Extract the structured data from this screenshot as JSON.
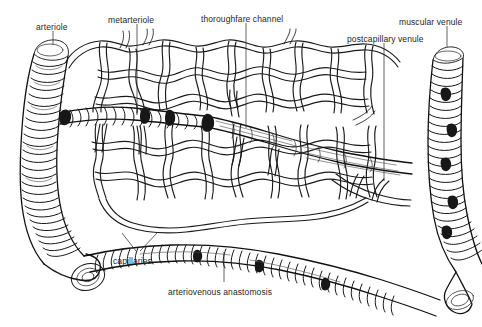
{
  "figure": {
    "background_color": "#ffffff",
    "ink_color": "#1a1a1a",
    "text_color": "#262626",
    "width": 482,
    "height": 327
  },
  "labels": [
    {
      "id": "arteriole",
      "text": "arteriole",
      "x": 36,
      "y": 22
    },
    {
      "id": "metarteriole",
      "text": "metarteriole",
      "x": 108,
      "y": 15
    },
    {
      "id": "thoroughfare-channel",
      "text": "thoroughfare channel",
      "x": 201,
      "y": 14
    },
    {
      "id": "postcapillary-venule",
      "text": "postcapillary venule",
      "x": 347,
      "y": 34
    },
    {
      "id": "muscular-venule",
      "text": "muscular venule",
      "x": 399,
      "y": 17
    },
    {
      "id": "capillaries",
      "text": "capillaries",
      "x": 113,
      "y": 256
    },
    {
      "id": "arteriovenous-anastomosis",
      "text": "arteriovenous anastomosis",
      "x": 168,
      "y": 287
    }
  ],
  "structures": [
    {
      "id": "arteriole-vessel",
      "name": "arteriole"
    },
    {
      "id": "metarteriole-vessel",
      "name": "metarteriole"
    },
    {
      "id": "thoroughfare-vessel",
      "name": "thoroughfare channel"
    },
    {
      "id": "capillary-network",
      "name": "capillary network"
    },
    {
      "id": "postcapillary-venule-vessel",
      "name": "postcapillary venule"
    },
    {
      "id": "muscular-venule-vessel",
      "name": "muscular venule"
    },
    {
      "id": "av-anastomosis-vessel",
      "name": "arteriovenous anastomosis"
    }
  ]
}
